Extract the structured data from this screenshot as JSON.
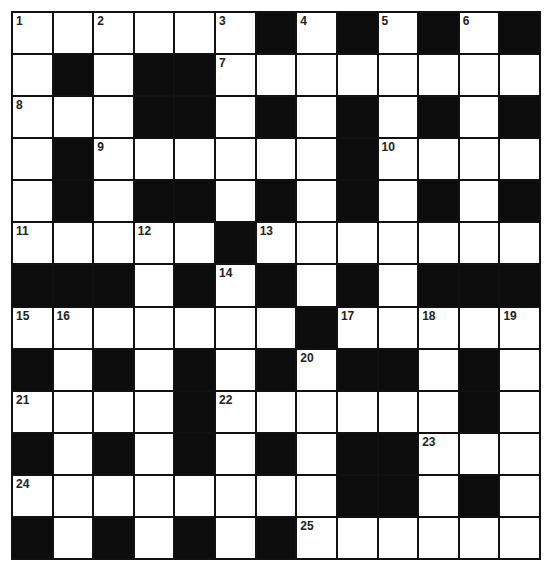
{
  "puzzle": {
    "rows": 13,
    "cols": 13,
    "grid": [
      "......#.#.#.#",
      ".#.##........",
      "...##.#.#.#.#",
      ".#......#....",
      ".#.##.#.#.#.#",
      ".....#.......",
      "###.#.#.#.###",
      ".......#.....",
      "#.#.#.#.##.#.",
      "....#......#.",
      "#.#.#.#.##...",
      "........##.#.",
      "#.#.#.#......"
    ],
    "numbers": [
      {
        "n": "1",
        "r": 0,
        "c": 0
      },
      {
        "n": "2",
        "r": 0,
        "c": 2
      },
      {
        "n": "3",
        "r": 0,
        "c": 5
      },
      {
        "n": "4",
        "r": 0,
        "c": 7
      },
      {
        "n": "5",
        "r": 0,
        "c": 9
      },
      {
        "n": "6",
        "r": 0,
        "c": 11
      },
      {
        "n": "7",
        "r": 1,
        "c": 5
      },
      {
        "n": "8",
        "r": 2,
        "c": 0
      },
      {
        "n": "9",
        "r": 3,
        "c": 2
      },
      {
        "n": "10",
        "r": 3,
        "c": 9
      },
      {
        "n": "11",
        "r": 5,
        "c": 0
      },
      {
        "n": "12",
        "r": 5,
        "c": 3
      },
      {
        "n": "13",
        "r": 5,
        "c": 6
      },
      {
        "n": "14",
        "r": 6,
        "c": 5
      },
      {
        "n": "15",
        "r": 7,
        "c": 0
      },
      {
        "n": "16",
        "r": 7,
        "c": 1
      },
      {
        "n": "17",
        "r": 7,
        "c": 8
      },
      {
        "n": "18",
        "r": 7,
        "c": 10
      },
      {
        "n": "19",
        "r": 7,
        "c": 12
      },
      {
        "n": "20",
        "r": 8,
        "c": 7
      },
      {
        "n": "21",
        "r": 9,
        "c": 0
      },
      {
        "n": "22",
        "r": 9,
        "c": 5
      },
      {
        "n": "23",
        "r": 10,
        "c": 10
      },
      {
        "n": "24",
        "r": 11,
        "c": 0
      },
      {
        "n": "25",
        "r": 12,
        "c": 7
      }
    ],
    "colors": {
      "block": "#0c0c0c",
      "cell": "#ffffff",
      "line": "#111111"
    }
  }
}
